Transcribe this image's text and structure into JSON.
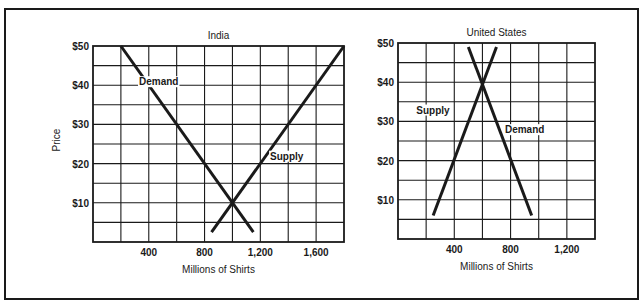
{
  "chart_data": [
    {
      "type": "line",
      "title": "India",
      "xlabel": "Millions of Shirts",
      "ylabel": "Price",
      "xlim": [
        0,
        1800
      ],
      "ylim": [
        0,
        50
      ],
      "x_ticks": [
        400,
        800,
        1200,
        1600
      ],
      "x_tick_labels": [
        "400",
        "800",
        "1,200",
        "1,600"
      ],
      "y_ticks": [
        10,
        20,
        30,
        40,
        50
      ],
      "y_tick_labels": [
        "$10",
        "$20",
        "$30",
        "$40",
        "$50"
      ],
      "grid": true,
      "grid_x_step": 200,
      "grid_y_step": 5,
      "series": [
        {
          "name": "Demand",
          "points": [
            [
              200,
              50
            ],
            [
              1150,
              2.5
            ]
          ],
          "label_at": [
            330,
            40
          ]
        },
        {
          "name": "Supply",
          "points": [
            [
              850,
              2.5
            ],
            [
              1800,
              50
            ]
          ],
          "label_at": [
            1270,
            21
          ]
        }
      ],
      "equilibrium": {
        "quantity": 1000,
        "price": 10
      }
    },
    {
      "type": "line",
      "title": "United States",
      "xlabel": "Millions of Shirts",
      "ylabel": "",
      "xlim": [
        0,
        1400
      ],
      "ylim": [
        0,
        50
      ],
      "x_ticks": [
        400,
        800,
        1200
      ],
      "x_tick_labels": [
        "400",
        "800",
        "1,200"
      ],
      "y_ticks": [
        10,
        20,
        30,
        40,
        50
      ],
      "y_tick_labels": [
        "$10",
        "$20",
        "$30",
        "$40",
        "$50"
      ],
      "grid": true,
      "grid_x_step": 200,
      "grid_y_step": 5,
      "series": [
        {
          "name": "Supply",
          "points": [
            [
              250,
              6
            ],
            [
              700,
              49
            ]
          ],
          "label_at": [
            130,
            32
          ]
        },
        {
          "name": "Demand",
          "points": [
            [
              500,
              49
            ],
            [
              950,
              6
            ]
          ],
          "label_at": [
            760,
            27
          ]
        }
      ],
      "equilibrium": {
        "quantity": 600,
        "price": 40
      }
    }
  ],
  "layout": [
    {
      "plot": {
        "x": 93,
        "y": 46,
        "w": 251,
        "h": 196
      }
    },
    {
      "plot": {
        "x": 398,
        "y": 43,
        "w": 197,
        "h": 196
      }
    }
  ]
}
